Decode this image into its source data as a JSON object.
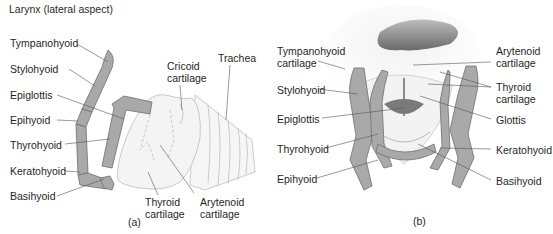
{
  "title": "Larynx (lateral aspect)",
  "panel_a": {
    "caption": "(a)",
    "labels": {
      "tympanohyoid": "Tympanohyoid",
      "stylohyoid": "Stylohyoid",
      "epiglottis": "Epiglottis",
      "epihyoid": "Epihyoid",
      "thyrohyoid": "Thyrohyoid",
      "keratohyoid": "Keratohyoid",
      "basihyoid": "Basihyoid",
      "cricoid_1": "Cricoid",
      "cricoid_2": "cartilage",
      "trachea": "Trachea",
      "thyroid_1": "Thyroid",
      "thyroid_2": "cartilage",
      "arytenoid_1": "Arytenoid",
      "arytenoid_2": "cartilage"
    }
  },
  "panel_b": {
    "caption": "(b)",
    "labels": {
      "tympanohyoid_1": "Tympanohyoid",
      "tympanohyoid_2": "cartilage",
      "stylohyoid": "Stylohyoid",
      "epiglottis": "Epiglottis",
      "thyrohyoid": "Thyrohyoid",
      "epihyoid": "Epihyoid",
      "arytenoid_1": "Arytenoid",
      "arytenoid_2": "cartilage",
      "thyroid_1": "Thyroid",
      "thyroid_2": "cartilage",
      "glottis": "Glottis",
      "keratohyoid": "Keratohyoid",
      "basihyoid": "Basihyoid"
    }
  },
  "colors": {
    "bone": "#a9a9a9",
    "bone_outline": "#6f6f6f",
    "cartilage": "#f1f1f1",
    "leader": "#555555",
    "dark_cavity": "#707070"
  }
}
